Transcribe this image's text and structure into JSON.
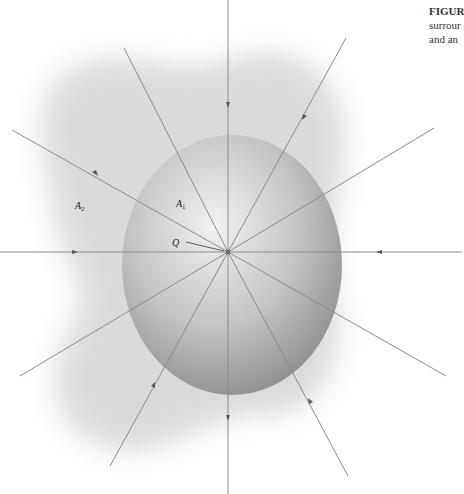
{
  "caption": {
    "title": "FIGUR",
    "line1": "surrour",
    "line2": "and an"
  },
  "figure": {
    "charge_label": "Q",
    "surface_inner": {
      "letter": "A",
      "sub": "1"
    },
    "surface_outer": {
      "letter": "A",
      "sub": "2"
    },
    "center": [
      228,
      252
    ],
    "field_line_count": 12,
    "colors": {
      "line": "#8a8a8a",
      "arrow": "#555555",
      "sphere": "#9a9a9a",
      "blob": "#d8d8d8"
    }
  }
}
